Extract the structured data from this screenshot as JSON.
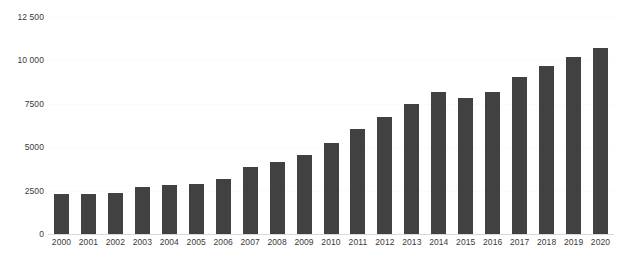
{
  "chart_data": {
    "type": "bar",
    "title": "",
    "subtitle": "",
    "xlabel": "",
    "ylabel": "",
    "categories": [
      "2000",
      "2001",
      "2002",
      "2003",
      "2004",
      "2005",
      "2006",
      "2007",
      "2008",
      "2009",
      "2010",
      "2011",
      "2012",
      "2013",
      "2014",
      "2015",
      "2016",
      "2017",
      "2018",
      "2019",
      "2020"
    ],
    "values": [
      2300,
      2330,
      2340,
      2700,
      2850,
      2900,
      3150,
      3850,
      4150,
      4550,
      5250,
      6050,
      6750,
      7500,
      8200,
      7850,
      8200,
      9050,
      9650,
      10200,
      10700
    ],
    "series": [
      {
        "name": "",
        "values": [
          2300,
          2330,
          2340,
          2700,
          2850,
          2900,
          3150,
          3850,
          4150,
          4550,
          5250,
          6050,
          6750,
          7500,
          8200,
          7850,
          8200,
          9050,
          9650,
          10200,
          10700
        ]
      }
    ],
    "ylim": [
      0,
      12500
    ],
    "y_ticks": [
      0,
      2500,
      5000,
      7500,
      10000,
      12500
    ],
    "y_tick_labels": [
      "0",
      "2500",
      "5000",
      "7500",
      "10 000",
      "12 500"
    ],
    "grid": true,
    "legend": false,
    "legend_position": "none",
    "bar_color": "#414141",
    "background_color": "#ffffff",
    "axis_color": "#d8d8d8",
    "gridline_color": "#fbfbfb"
  }
}
